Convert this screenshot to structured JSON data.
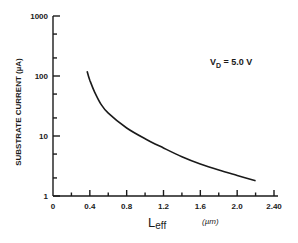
{
  "chart_data": {
    "type": "line",
    "title": "",
    "xlabel": "Leff",
    "xlabel_main": "L",
    "xlabel_sub": "eff",
    "xunit": "(µm)",
    "ylabel": "SUBSTRATE CURRENT (µA)",
    "yscale": "log",
    "xlim": [
      0,
      2.4
    ],
    "ylim": [
      1,
      1000
    ],
    "x_ticks": [
      "0",
      "0.4",
      "0.8",
      "1.2",
      "1.6",
      "2.0",
      "2.40"
    ],
    "y_ticks": [
      "1",
      "10",
      "100",
      "1000"
    ],
    "grid": false,
    "annotations": [
      {
        "text_main": "V",
        "text_sub": "D",
        "text_rest": " = 5.0 V"
      }
    ],
    "series": [
      {
        "name": "VD = 5.0 V",
        "x": [
          0.37,
          0.4,
          0.45,
          0.52,
          0.6,
          0.8,
          1.0,
          1.2,
          1.4,
          1.6,
          1.8,
          2.0,
          2.2
        ],
        "values": [
          120,
          85,
          55,
          34,
          24,
          13.6,
          9,
          6.3,
          4.5,
          3.4,
          2.7,
          2.2,
          1.8
        ]
      }
    ]
  }
}
